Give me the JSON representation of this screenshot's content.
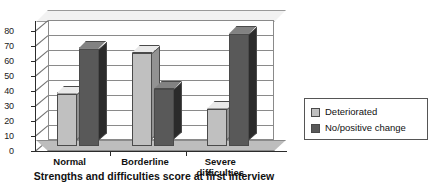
{
  "chart_data": {
    "type": "bar",
    "title": "",
    "subtitle": "",
    "xlabel": "Strengths and difficulties score at first interview",
    "ylabel": "",
    "categories": [
      "Normal",
      "Borderline",
      "Severe difficulties"
    ],
    "category_lines": [
      [
        "Normal"
      ],
      [
        "Borderline"
      ],
      [
        "Severe",
        "difficulties"
      ]
    ],
    "series": [
      {
        "name": "Deteriorated",
        "values": [
          35,
          62,
          25
        ],
        "color": "#c0c0c0"
      },
      {
        "name": "No/positive change",
        "values": [
          65,
          38,
          75
        ],
        "color": "#595959"
      }
    ],
    "ylim": [
      0,
      80
    ],
    "ytick_step": 10,
    "yticks": [
      "80",
      "70",
      "60",
      "50",
      "40",
      "30",
      "20",
      "10",
      "0"
    ],
    "grid": true,
    "legend_position": "right",
    "style": "3d-clustered-column",
    "background": "#ffffff"
  },
  "legend": {
    "items": [
      {
        "label": "Deteriorated",
        "swatch": "#c0c0c0"
      },
      {
        "label": "No/positive change",
        "swatch": "#595959"
      }
    ]
  }
}
